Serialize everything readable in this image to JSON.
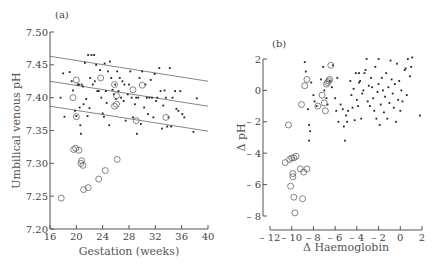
{
  "chart_data": [
    {
      "panel_label": "(a)",
      "type": "scatter",
      "title": "",
      "xlabel": "Gestation (weeks)",
      "ylabel": "Umbilical venous pH",
      "xlim": [
        16,
        40
      ],
      "ylim": [
        7.2,
        7.5
      ],
      "xticks": [
        16,
        20,
        24,
        28,
        32,
        36,
        40
      ],
      "yticks": [
        7.2,
        7.25,
        7.3,
        7.35,
        7.4,
        7.45,
        7.5
      ],
      "ytick_labels": [
        "7.20",
        "7.25",
        "7.30",
        "7.35",
        "7.40",
        "7.45",
        "7.50"
      ],
      "grid": false,
      "legend": null,
      "lines": [
        {
          "name": "upper reference",
          "x": [
            16,
            40
          ],
          "y": [
            7.463,
            7.425
          ]
        },
        {
          "name": "mean regression",
          "x": [
            16,
            40
          ],
          "y": [
            7.425,
            7.387
          ]
        },
        {
          "name": "lower reference",
          "x": [
            16,
            40
          ],
          "y": [
            7.387,
            7.349
          ]
        }
      ],
      "series": [
        {
          "name": "normal (dots)",
          "marker": "dot",
          "points": [
            [
              17.6,
              7.4
            ],
            [
              18.0,
              7.437
            ],
            [
              18.2,
              7.371
            ],
            [
              19.0,
              7.439
            ],
            [
              19.3,
              7.425
            ],
            [
              19.5,
              7.411
            ],
            [
              19.8,
              7.38
            ],
            [
              20.0,
              7.372
            ],
            [
              20.2,
              7.42
            ],
            [
              20.4,
              7.42
            ],
            [
              20.5,
              7.385
            ],
            [
              20.6,
              7.358
            ],
            [
              20.7,
              7.345
            ],
            [
              20.8,
              7.42
            ],
            [
              21.0,
              7.417
            ],
            [
              21.1,
              7.39
            ],
            [
              21.3,
              7.453
            ],
            [
              21.5,
              7.398
            ],
            [
              21.7,
              7.372
            ],
            [
              21.8,
              7.465
            ],
            [
              22.0,
              7.384
            ],
            [
              22.1,
              7.43
            ],
            [
              22.3,
              7.465
            ],
            [
              22.5,
              7.42
            ],
            [
              22.7,
              7.465
            ],
            [
              22.8,
              7.425
            ],
            [
              23.0,
              7.45
            ],
            [
              23.2,
              7.41
            ],
            [
              23.4,
              7.41
            ],
            [
              23.6,
              7.442
            ],
            [
              23.8,
              7.4
            ],
            [
              24.0,
              7.376
            ],
            [
              24.2,
              7.371
            ],
            [
              24.3,
              7.452
            ],
            [
              24.5,
              7.41
            ],
            [
              24.6,
              7.392
            ],
            [
              24.8,
              7.44
            ],
            [
              25.0,
              7.358
            ],
            [
              25.1,
              7.455
            ],
            [
              25.3,
              7.43
            ],
            [
              25.5,
              7.412
            ],
            [
              25.7,
              7.405
            ],
            [
              25.9,
              7.42
            ],
            [
              26.0,
              7.398
            ],
            [
              26.2,
              7.44
            ],
            [
              26.4,
              7.41
            ],
            [
              26.6,
              7.43
            ],
            [
              26.8,
              7.4
            ],
            [
              27.0,
              7.425
            ],
            [
              27.2,
              7.395
            ],
            [
              27.3,
              7.42
            ],
            [
              27.5,
              7.365
            ],
            [
              27.8,
              7.405
            ],
            [
              28.0,
              7.42
            ],
            [
              28.2,
              7.44
            ],
            [
              28.4,
              7.4
            ],
            [
              28.6,
              7.37
            ],
            [
              28.9,
              7.39
            ],
            [
              29.1,
              7.4
            ],
            [
              29.2,
              7.345
            ],
            [
              29.4,
              7.4
            ],
            [
              29.6,
              7.43
            ],
            [
              29.8,
              7.36
            ],
            [
              30.0,
              7.44
            ],
            [
              30.3,
              7.385
            ],
            [
              30.5,
              7.42
            ],
            [
              30.7,
              7.4
            ],
            [
              30.9,
              7.375
            ],
            [
              31.1,
              7.4
            ],
            [
              31.3,
              7.427
            ],
            [
              31.5,
              7.4
            ],
            [
              31.7,
              7.37
            ],
            [
              31.9,
              7.436
            ],
            [
              32.1,
              7.395
            ],
            [
              32.3,
              7.4
            ],
            [
              32.6,
              7.445
            ],
            [
              32.8,
              7.41
            ],
            [
              33.0,
              7.353
            ],
            [
              33.2,
              7.388
            ],
            [
              33.4,
              7.411
            ],
            [
              33.6,
              7.4
            ],
            [
              33.8,
              7.356
            ],
            [
              34.0,
              7.37
            ],
            [
              34.2,
              7.445
            ],
            [
              34.4,
              7.356
            ],
            [
              34.6,
              7.4
            ],
            [
              35.0,
              7.41
            ],
            [
              35.2,
              7.383
            ],
            [
              35.5,
              7.38
            ],
            [
              35.8,
              7.41
            ],
            [
              36.1,
              7.375
            ],
            [
              36.4,
              7.37
            ],
            [
              37.8,
              7.348
            ],
            [
              38.3,
              7.399
            ]
          ]
        },
        {
          "name": "abnormal (open circles)",
          "marker": "open-circle",
          "points": [
            [
              17.7,
              7.247
            ],
            [
              19.5,
              7.4
            ],
            [
              19.6,
              7.321
            ],
            [
              19.9,
              7.323
            ],
            [
              20.0,
              7.427
            ],
            [
              20.0,
              7.371
            ],
            [
              20.4,
              7.32
            ],
            [
              20.7,
              7.3
            ],
            [
              20.8,
              7.304
            ],
            [
              21.0,
              7.297
            ],
            [
              21.1,
              7.26
            ],
            [
              21.8,
              7.263
            ],
            [
              23.4,
              7.276
            ],
            [
              23.7,
              7.43
            ],
            [
              24.4,
              7.289
            ],
            [
              25.8,
              7.42
            ],
            [
              25.8,
              7.387
            ],
            [
              26.1,
              7.39
            ],
            [
              26.1,
              7.403
            ],
            [
              26.2,
              7.306
            ],
            [
              28.6,
              7.412
            ],
            [
              29.1,
              7.365
            ],
            [
              30.0,
              7.419
            ],
            [
              33.6,
              7.37
            ]
          ]
        }
      ]
    },
    {
      "panel_label": "(b)",
      "type": "scatter",
      "title": "",
      "xlabel": "Δ Haemoglobin",
      "ylabel": "Δ pH",
      "xlim": [
        -12,
        2
      ],
      "ylim": [
        -8,
        2
      ],
      "xticks": [
        -12,
        -10,
        -8,
        -6,
        -4,
        -2,
        0,
        2
      ],
      "xtick_labels": [
        "– 12",
        "– 10",
        "– 8",
        "– 6",
        "– 4",
        "– 2",
        "0",
        "2"
      ],
      "yticks": [
        -8,
        -6,
        -4,
        -2,
        0,
        2
      ],
      "ytick_labels": [
        "– 8",
        "– 6",
        "– 4",
        "– 2",
        "0",
        "2"
      ],
      "grid": false,
      "legend": null,
      "series": [
        {
          "name": "normal (dots)",
          "marker": "dot",
          "points": [
            [
              -8.8,
              1.8
            ],
            [
              -8.7,
              1.2
            ],
            [
              -8.5,
              -1.2
            ],
            [
              -8.4,
              -2.2
            ],
            [
              -8.3,
              -2.6
            ],
            [
              -8.4,
              -3.2
            ],
            [
              -8.2,
              0.5
            ],
            [
              -8.0,
              -0.3
            ],
            [
              -7.9,
              -0.7
            ],
            [
              -7.7,
              -1.0
            ],
            [
              -7.3,
              0.7
            ],
            [
              -7.1,
              1.5
            ],
            [
              -7.0,
              0.0
            ],
            [
              -6.8,
              -0.5
            ],
            [
              -6.7,
              -0.9
            ],
            [
              -6.5,
              0.6
            ],
            [
              -6.3,
              0.2
            ],
            [
              -6.2,
              1.6
            ],
            [
              -6.0,
              -0.5
            ],
            [
              -5.8,
              0.8
            ],
            [
              -5.7,
              -2.0
            ],
            [
              -5.5,
              -0.9
            ],
            [
              -5.3,
              -1.2
            ],
            [
              -5.2,
              -2.3
            ],
            [
              -5.1,
              -3.2
            ],
            [
              -5.0,
              -1.6
            ],
            [
              -4.8,
              -1.3
            ],
            [
              -4.6,
              0.6
            ],
            [
              -4.5,
              -0.3
            ],
            [
              -4.4,
              -1.1
            ],
            [
              -4.3,
              0.1
            ],
            [
              -4.2,
              -1.9
            ],
            [
              -4.1,
              1.1
            ],
            [
              -4.0,
              -0.6
            ],
            [
              -3.9,
              -1.0
            ],
            [
              -3.8,
              0.5
            ],
            [
              -3.7,
              0.6
            ],
            [
              -3.6,
              -1.8
            ],
            [
              -3.5,
              -0.2
            ],
            [
              -3.4,
              0.0
            ],
            [
              -3.3,
              1.1
            ],
            [
              -3.2,
              1.3
            ],
            [
              -3.1,
              2.0
            ],
            [
              -3.0,
              -0.7
            ],
            [
              -2.9,
              0.3
            ],
            [
              -2.8,
              -1.0
            ],
            [
              -2.7,
              0.8
            ],
            [
              -2.6,
              0.2
            ],
            [
              -2.5,
              -0.5
            ],
            [
              -2.4,
              -1.3
            ],
            [
              -2.3,
              1.5
            ],
            [
              -2.2,
              -1.8
            ],
            [
              -2.1,
              -0.1
            ],
            [
              -2.0,
              0.4
            ],
            [
              -1.9,
              -2.2
            ],
            [
              -1.8,
              -0.9
            ],
            [
              -1.7,
              0.8
            ],
            [
              -1.6,
              0.0
            ],
            [
              -1.5,
              -1.4
            ],
            [
              -1.4,
              -0.4
            ],
            [
              -1.3,
              1.1
            ],
            [
              -1.2,
              -1.8
            ],
            [
              -1.1,
              0.2
            ],
            [
              -1.0,
              -0.8
            ],
            [
              -0.9,
              1.9
            ],
            [
              -0.8,
              0.7
            ],
            [
              -0.7,
              -0.2
            ],
            [
              -0.6,
              -1.1
            ],
            [
              -0.5,
              0.4
            ],
            [
              -0.4,
              -2.0
            ],
            [
              -0.3,
              1.7
            ],
            [
              -0.2,
              -0.6
            ],
            [
              -0.1,
              0.6
            ],
            [
              0.0,
              -1.3
            ],
            [
              0.1,
              0.0
            ],
            [
              0.2,
              -0.7
            ],
            [
              0.4,
              1.3
            ],
            [
              0.5,
              1.4
            ],
            [
              0.6,
              -0.3
            ],
            [
              0.7,
              2.0
            ],
            [
              0.9,
              0.9
            ],
            [
              1.0,
              1.5
            ],
            [
              1.1,
              2.1
            ],
            [
              1.8,
              -1.6
            ],
            [
              -2.0,
              2.0
            ],
            [
              -3.8,
              1.1
            ],
            [
              -4.9,
              -2.0
            ],
            [
              -5.9,
              -1.3
            ]
          ]
        },
        {
          "name": "abnormal (open circles)",
          "marker": "open-circle",
          "points": [
            [
              -10.3,
              -2.2
            ],
            [
              -10.6,
              -4.6
            ],
            [
              -10.2,
              -4.4
            ],
            [
              -10.0,
              -4.3
            ],
            [
              -9.8,
              -4.3
            ],
            [
              -9.6,
              -4.2
            ],
            [
              -9.9,
              -5.3
            ],
            [
              -9.9,
              -5.5
            ],
            [
              -10.1,
              -6.1
            ],
            [
              -9.8,
              -6.8
            ],
            [
              -9.7,
              -7.8
            ],
            [
              -9.2,
              -5.0
            ],
            [
              -8.9,
              -5.2
            ],
            [
              -8.6,
              -5.0
            ],
            [
              -9.0,
              -6.9
            ],
            [
              -9.1,
              -0.9
            ],
            [
              -8.8,
              0.3
            ],
            [
              -8.6,
              0.7
            ],
            [
              -7.6,
              -1.0
            ],
            [
              -7.2,
              -0.3
            ],
            [
              -7.0,
              -0.8
            ],
            [
              -6.9,
              -1.3
            ],
            [
              -6.8,
              0.4
            ],
            [
              -6.7,
              0.5
            ],
            [
              -6.6,
              0.6
            ],
            [
              -6.5,
              0.7
            ],
            [
              -6.4,
              1.6
            ]
          ]
        }
      ]
    }
  ]
}
